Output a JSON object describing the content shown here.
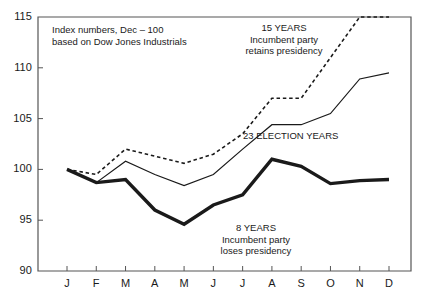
{
  "chart_data": {
    "type": "line",
    "title": "",
    "subtitle": "",
    "note": {
      "line1": "Index numbers, Dec – 100",
      "line2": "based on Dow Jones Industrials"
    },
    "xlabel": "",
    "ylabel": "",
    "categories": [
      "J",
      "F",
      "M",
      "A",
      "M",
      "J",
      "J",
      "A",
      "S",
      "O",
      "N",
      "D"
    ],
    "xlim": [
      0,
      11
    ],
    "ylim": [
      90,
      115
    ],
    "yticks": [
      90,
      95,
      100,
      105,
      110,
      115
    ],
    "ytick_labels": [
      "90",
      "95",
      "100",
      "105",
      "110",
      "115"
    ],
    "grid": false,
    "legend_position": "inline-annotations",
    "series": [
      {
        "name": "15 YEARS",
        "annotation": {
          "line1": "15 YEARS",
          "line2": "Incumbent party",
          "line3": "retains presidency"
        },
        "style": "dashed",
        "color": "#1a1a1a",
        "width": 1.6,
        "values": [
          100.0,
          99.5,
          102.0,
          101.3,
          100.6,
          101.5,
          103.5,
          107.0,
          107.0,
          111.0,
          115.0,
          115.0
        ]
      },
      {
        "name": "23 ELECTION YEARS",
        "annotation": {
          "line1": "23 ELECTION YEARS"
        },
        "style": "solid-thin",
        "color": "#1a1a1a",
        "width": 1.2,
        "values": [
          100.0,
          98.7,
          100.8,
          99.5,
          98.4,
          99.5,
          102.0,
          104.4,
          104.4,
          105.5,
          108.9,
          109.5
        ]
      },
      {
        "name": "8 YEARS",
        "annotation": {
          "line1": "8 YEARS",
          "line2": "Incumbent party",
          "line3": "loses presidency"
        },
        "style": "solid-thick",
        "color": "#1a1a1a",
        "width": 3.4,
        "values": [
          100.0,
          98.7,
          99.0,
          96.0,
          94.6,
          96.5,
          97.5,
          101.0,
          100.3,
          98.6,
          98.9,
          99.0
        ]
      }
    ],
    "colors": {
      "axis": "#555555",
      "line": "#1a1a1a",
      "background": "#ffffff"
    }
  }
}
